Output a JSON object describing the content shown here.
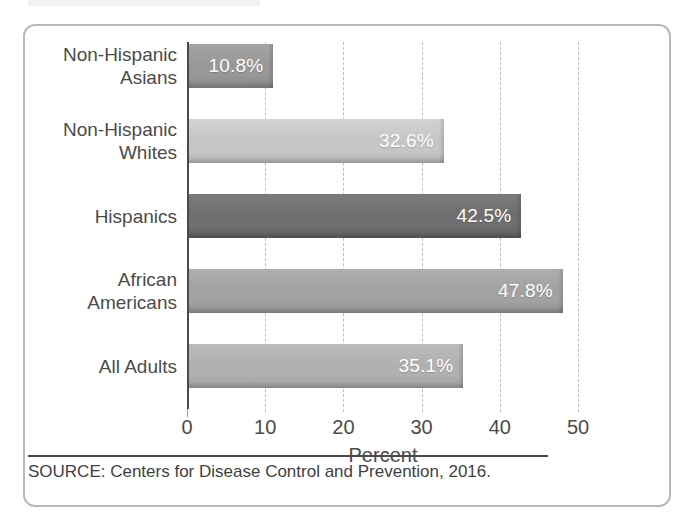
{
  "figure": {
    "source_note": "SOURCE: Centers for Disease Control and Prevention, 2016."
  },
  "chart_data": {
    "type": "bar",
    "orientation": "horizontal",
    "title": "",
    "xlabel": "Percent",
    "ylabel": "",
    "xlim": [
      0,
      50
    ],
    "xticks": [
      "0",
      "10",
      "20",
      "30",
      "40",
      "50"
    ],
    "grid": "vertical-dashed",
    "legend": "none",
    "categories": [
      "Non-Hispanic\nAsians",
      "Non-Hispanic\nWhites",
      "Hispanics",
      "African\nAmericans",
      "All Adults"
    ],
    "values": [
      10.8,
      32.6,
      42.5,
      47.8,
      35.1
    ],
    "value_labels": [
      "10.8%",
      "32.6%",
      "42.5%",
      "47.8%",
      "35.1%"
    ],
    "bar_colors": [
      "#989898",
      "#c6c6c6",
      "#6f6f6f",
      "#a2a2a2",
      "#b0b0b0"
    ]
  },
  "ticks": [
    {
      "label": "0",
      "value": 0
    },
    {
      "label": "10",
      "value": 10
    },
    {
      "label": "20",
      "value": 20
    },
    {
      "label": "30",
      "value": 30
    },
    {
      "label": "40",
      "value": 40
    },
    {
      "label": "50",
      "value": 50
    }
  ]
}
